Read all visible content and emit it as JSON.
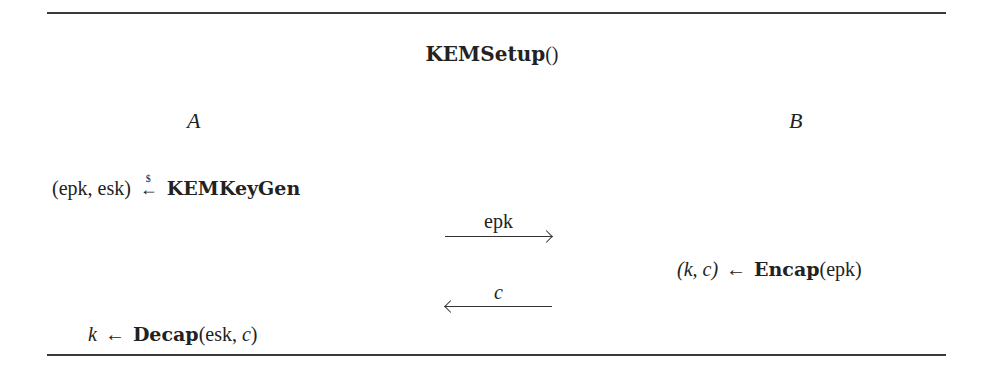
{
  "protocol": {
    "title": "KEMSetup()",
    "title_name": "KEMSetup",
    "title_parens": "()",
    "parties": {
      "a": "A",
      "b": "B"
    }
  },
  "steps": {
    "keygen": {
      "lhs": "(epk, esk)",
      "op_symbol": "←",
      "op_superscript": "$",
      "rhs_func": "KEMKeyGen"
    },
    "encap": {
      "lhs": "(k, c)",
      "op_symbol": "←",
      "rhs_func": "Encap",
      "rhs_args": "(epk)"
    },
    "decap": {
      "lhs": "k",
      "op_symbol": "←",
      "rhs_func": "Decap",
      "rhs_args_open": "(esk, ",
      "rhs_args_var": "c",
      "rhs_args_close": ")"
    }
  },
  "messages": [
    {
      "label": "epk",
      "direction": "A→B"
    },
    {
      "label": "c",
      "direction": "B→A"
    }
  ]
}
